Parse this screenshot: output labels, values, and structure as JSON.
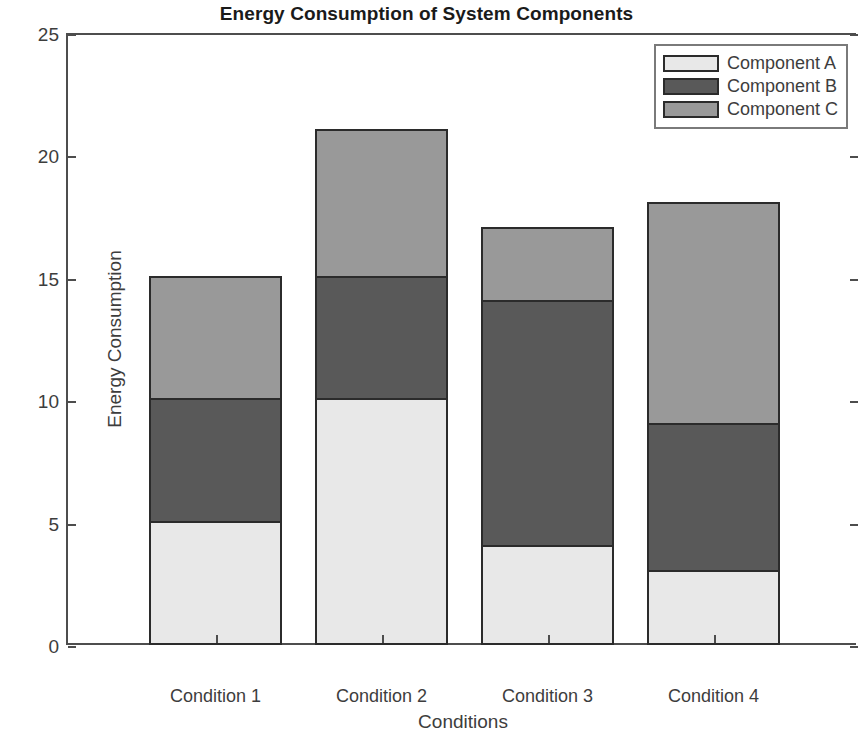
{
  "chart_data": {
    "type": "bar",
    "variant": "stacked",
    "title": "Energy Consumption of System Components",
    "xlabel": "Conditions",
    "ylabel": "Energy Consumption",
    "categories": [
      "Condition 1",
      "Condition 2",
      "Condition 3",
      "Condition 4"
    ],
    "series": [
      {
        "name": "Component A",
        "values": [
          5,
          10,
          4,
          3
        ],
        "color": "#e8e8e8"
      },
      {
        "name": "Component B",
        "values": [
          5,
          5,
          10,
          6
        ],
        "color": "#595959"
      },
      {
        "name": "Component C",
        "values": [
          5,
          6,
          3,
          9
        ],
        "color": "#999999"
      }
    ],
    "totals": [
      15,
      21,
      17,
      18
    ],
    "ylim": [
      0,
      25
    ],
    "yticks": [
      0,
      5,
      10,
      15,
      20,
      25
    ],
    "ytick_labels": [
      "0",
      "5",
      "10",
      "15",
      "20",
      "25"
    ],
    "grid": false,
    "legend_position": "upper right",
    "edge_color": "#2b2b2b",
    "axis_color": "#4d4d4d",
    "background": "#ffffff"
  },
  "legend": {
    "entries": [
      "Component A",
      "Component B",
      "Component C"
    ]
  }
}
